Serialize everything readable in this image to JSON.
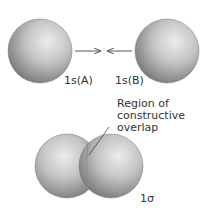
{
  "diagram": {
    "top": {
      "orbital_a_label": "1s(A)",
      "orbital_b_label": "1s(B)"
    },
    "bottom": {
      "annotation_line1": "Region of",
      "annotation_line2": "constructive",
      "annotation_line3": "overlap",
      "bond_label": "1σ"
    },
    "colors": {
      "sphere_light": "#e6e6e6",
      "sphere_mid": "#b5b5b5",
      "sphere_dark": "#6e6e6e",
      "arrow": "#555555",
      "text": "#333333"
    }
  }
}
